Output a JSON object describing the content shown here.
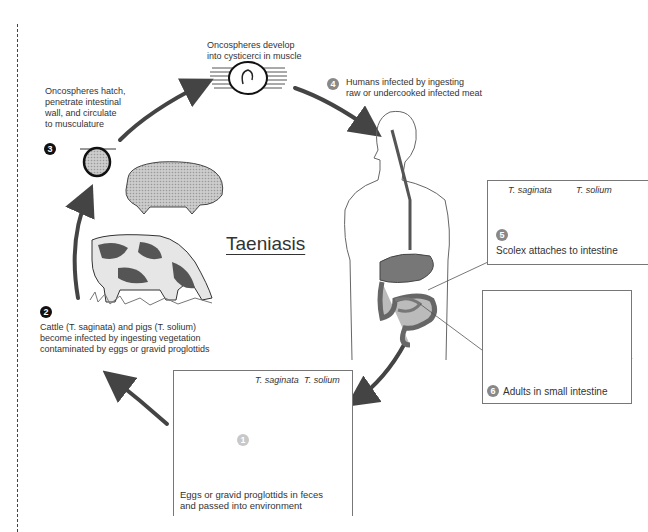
{
  "title": "Taeniasis",
  "stages": [
    {
      "number": "1",
      "text_lines": [
        "Eggs or gravid proglottids in feces",
        "and passed into environment"
      ],
      "species_labels": [
        "T. saginata",
        "T. solium"
      ]
    },
    {
      "number": "2",
      "text_lines": [
        "Cattle (T. saginata) and pigs (T. solium)",
        "become infected by ingesting vegetation",
        "contaminated by eggs or gravid proglottids"
      ]
    },
    {
      "number": "3",
      "text_lines": [
        "Oncospheres hatch,",
        "penetrate intestinal",
        "wall, and circulate",
        "to musculature"
      ]
    },
    {
      "number": "4",
      "text_lines": [
        "Humans infected by ingesting",
        "raw or undercooked infected meat"
      ]
    },
    {
      "number": "5",
      "text_lines": [
        "Scolex attaches to intestine"
      ],
      "species_labels": [
        "T. saginata",
        "T. solium"
      ]
    },
    {
      "number": "6",
      "text_lines": [
        "Adults in small intestine"
      ]
    }
  ],
  "top_label": [
    "Oncospheres develop",
    "into cysticerci in muscle"
  ],
  "icons": [
    "pig-illustration",
    "cow-illustration",
    "human-digestive-illustration",
    "cysticercus-icon",
    "oncosphere-icon",
    "egg-icon",
    "proglottid-icon",
    "scolex-icon",
    "adult-tapeworm-icon",
    "cycle-arrow-icon"
  ],
  "colors": {
    "arrow": "#444444",
    "text": "#333333",
    "organ_dark": "#666666",
    "organ_light": "#bbbbbb"
  }
}
